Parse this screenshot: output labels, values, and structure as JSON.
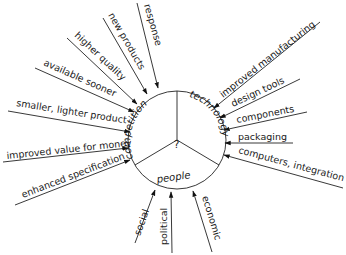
{
  "diagram": {
    "center_label": "?",
    "segments": [
      {
        "label": "competition"
      },
      {
        "label": "technology"
      },
      {
        "label": "people"
      }
    ],
    "competition_inputs": [
      {
        "label": "response"
      },
      {
        "label": "new products"
      },
      {
        "label": "higher quality"
      },
      {
        "label": "available sooner"
      },
      {
        "label": "smaller, lighter product"
      },
      {
        "label": "improved value for money"
      },
      {
        "label": "enhanced specification"
      }
    ],
    "technology_inputs": [
      {
        "label": "improved manufacturing"
      },
      {
        "label": "design tools"
      },
      {
        "label": "components"
      },
      {
        "label": "packaging"
      },
      {
        "label": "computers, integration"
      }
    ],
    "people_inputs": [
      {
        "label": "social"
      },
      {
        "label": "political"
      },
      {
        "label": "economic"
      }
    ]
  }
}
